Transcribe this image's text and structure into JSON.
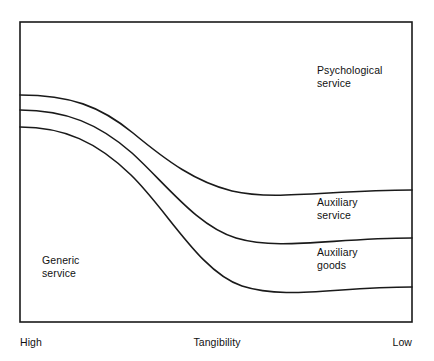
{
  "figure": {
    "frame": {
      "x": 20,
      "y": 22,
      "width": 392,
      "height": 300,
      "stroke": "#1a1a1a",
      "stroke_width": 1.6
    },
    "background": "#ffffff"
  },
  "bands": [
    {
      "id": "psychological-service",
      "label": "Psychological\nservice"
    },
    {
      "id": "auxiliary-service",
      "label": "Auxiliary\nservice"
    },
    {
      "id": "auxiliary-goods",
      "label": "Auxiliary\ngoods"
    },
    {
      "id": "generic-service",
      "label": "Generic\nservice"
    }
  ],
  "axis": {
    "title": "Tangibility",
    "left_label": "High",
    "right_label": "Low"
  },
  "chart_data": {
    "type": "line",
    "title": "",
    "xlabel": "Tangibility",
    "ylabel": "",
    "grid": false,
    "legend": null,
    "xlim": [
      0,
      1
    ],
    "ylim": [
      0,
      1
    ],
    "x_tick_labels": [
      "High",
      "Low"
    ],
    "annotations": [
      {
        "text": "Psychological service",
        "x": 0.76,
        "y": 0.84
      },
      {
        "text": "Auxiliary service",
        "x": 0.76,
        "y": 0.42
      },
      {
        "text": "Auxiliary goods",
        "x": 0.76,
        "y": 0.26
      },
      {
        "text": "Generic service",
        "x": 0.06,
        "y": 0.23
      }
    ],
    "series": [
      {
        "name": "psychological/auxiliary-service boundary",
        "stroke": "#1a1a1a",
        "path": "M 20 95 C 70 95 100 106 133 133 C 168 162 196 182 232 191 C 275 201 330 190 412 190",
        "x": [
          0.0,
          0.29,
          0.54,
          1.0
        ],
        "y": [
          0.757,
          0.63,
          0.437,
          0.44
        ]
      },
      {
        "name": "auxiliary-service/auxiliary-goods boundary",
        "stroke": "#1a1a1a",
        "path": "M 20 110 C 66 110 99 124 132 153 C 167 185 197 226 236 238 C 280 251 332 238 412 238",
        "x": [
          0.0,
          0.29,
          0.55,
          1.0
        ],
        "y": [
          0.707,
          0.563,
          0.287,
          0.28
        ]
      },
      {
        "name": "auxiliary-goods/generic-service boundary",
        "stroke": "#1a1a1a",
        "path": "M 20 127 C 64 127 97 142 131 175 C 168 211 200 272 242 286 C 286 300 334 287 412 287",
        "x": [
          0.0,
          0.28,
          0.57,
          1.0
        ],
        "y": [
          0.65,
          0.487,
          0.12,
          0.117
        ]
      }
    ]
  }
}
